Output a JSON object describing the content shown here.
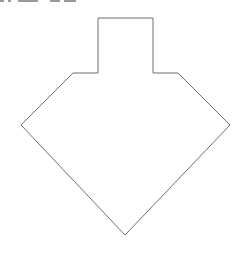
{
  "diagram": {
    "shape": "pentagon-house-with-chimney",
    "stroke_color": "#6e6e6e",
    "fill_color": "#ffffff",
    "stroke_width": 1,
    "points": [
      [
        98,
        18
      ],
      [
        153,
        18
      ],
      [
        153,
        73
      ],
      [
        178,
        73
      ],
      [
        230,
        125
      ],
      [
        125,
        235
      ],
      [
        21,
        125
      ],
      [
        73,
        73
      ],
      [
        98,
        73
      ]
    ]
  },
  "clipped_header": {
    "color": "#9a9a9a"
  }
}
